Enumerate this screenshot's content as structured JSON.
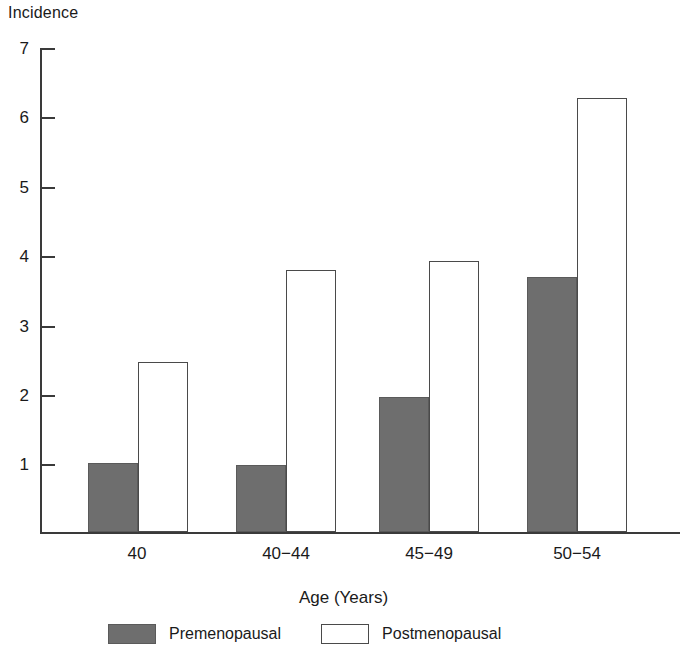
{
  "chart_data": {
    "type": "bar",
    "title": "",
    "ylabel": "Incidence",
    "xlabel": "Age (Years)",
    "categories": [
      "40",
      "40−44",
      "45−49",
      "50−54"
    ],
    "series": [
      {
        "name": "Premenopausal",
        "values": [
          1.0,
          0.97,
          1.95,
          3.68
        ],
        "color": "#6e6e6e"
      },
      {
        "name": "Postmenopausal",
        "values": [
          2.45,
          3.78,
          3.9,
          6.25
        ],
        "color": "#ffffff"
      }
    ],
    "ylim": [
      0,
      7
    ],
    "yticks": [
      1,
      2,
      3,
      4,
      5,
      6,
      7
    ],
    "ytick_labels": [
      "1",
      "2",
      "3",
      "4",
      "5",
      "6",
      "7"
    ],
    "grid": false,
    "legend_position": "bottom"
  },
  "axes": {
    "y_title": "Incidence",
    "x_title": "Age (Years)",
    "ytick_1": "1",
    "ytick_2": "2",
    "ytick_3": "3",
    "ytick_4": "4",
    "ytick_5": "5",
    "ytick_6": "6",
    "ytick_7": "7",
    "xtick_0": "40",
    "xtick_1": "40−44",
    "xtick_2": "45−49",
    "xtick_3": "50−54"
  },
  "legend": {
    "item_0_label": "Premenopausal",
    "item_1_label": "Postmenopausal"
  },
  "colors": {
    "premenopausal_fill": "#6e6e6e",
    "postmenopausal_fill": "#ffffff",
    "axis": "#3a3a3a"
  }
}
